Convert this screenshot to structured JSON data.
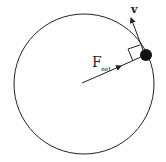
{
  "diagram": {
    "labels": {
      "velocity": "v",
      "force_main": "F",
      "force_sub": "net"
    },
    "colors": {
      "stroke": "#222222",
      "ball": "#111111",
      "background": "#ffffff"
    }
  }
}
